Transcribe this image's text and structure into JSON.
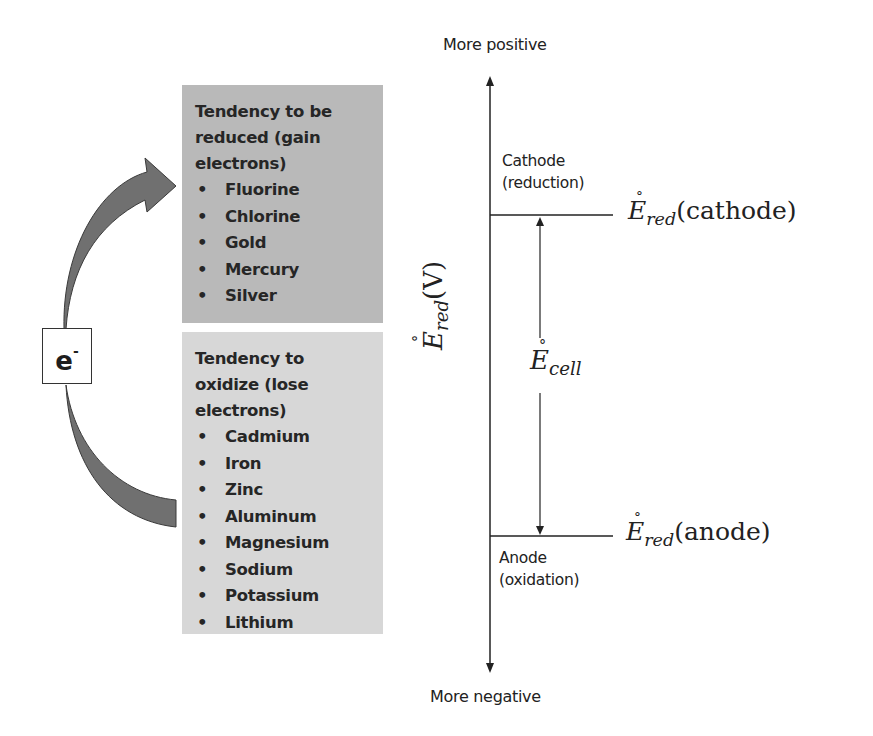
{
  "diagram": {
    "electron_label": {
      "base": "e",
      "sup": "-"
    },
    "reduced_box": {
      "heading_lines": [
        "Tendency to be",
        "reduced (gain",
        "electrons)"
      ],
      "items": [
        "Fluorine",
        "Chlorine",
        "Gold",
        "Mercury",
        "Silver"
      ],
      "fill_color": "#b9b9b9"
    },
    "oxidize_box": {
      "heading_lines": [
        "Tendency to",
        "oxidize (lose",
        "electrons)"
      ],
      "items": [
        "Cadmium",
        "Iron",
        "Zinc",
        "Aluminum",
        "Magnesium",
        "Sodium",
        "Potassium",
        "Lithium"
      ],
      "fill_color": "#d7d7d7"
    },
    "bullet": "•",
    "arrow_color": "#707070",
    "axis": {
      "top_label": "More positive",
      "bottom_label": "More negative",
      "y_label": {
        "symbol": "E",
        "degree": "°",
        "subscript": "red",
        "unit": "(V)"
      }
    },
    "cathode": {
      "label_lines": [
        "Cathode",
        "(reduction)"
      ],
      "potential": {
        "symbol": "E",
        "degree": "°",
        "subscript": "red",
        "arg": "(cathode)"
      }
    },
    "anode": {
      "label_lines": [
        "Anode",
        "(oxidation)"
      ],
      "potential": {
        "symbol": "E",
        "degree": "°",
        "subscript": "red",
        "arg": "(anode)"
      }
    },
    "cell": {
      "symbol": "E",
      "degree": "°",
      "subscript": "cell"
    }
  }
}
